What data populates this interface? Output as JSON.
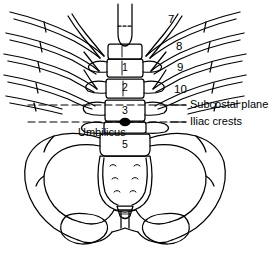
{
  "figure": {
    "style": {
      "line_color": "#000000",
      "background": "#ffffff",
      "text_color": "#000000"
    }
  },
  "rib_labels": [
    {
      "name": "rib-7",
      "text": "7",
      "x": 168,
      "y": 14
    },
    {
      "name": "rib-8",
      "text": "8",
      "x": 176,
      "y": 41
    },
    {
      "name": "rib-9",
      "text": "9",
      "x": 177,
      "y": 62
    },
    {
      "name": "rib-10",
      "text": "10",
      "x": 174,
      "y": 84
    }
  ],
  "vertebra_labels": [
    {
      "name": "lumbar-1",
      "text": "1",
      "x": 104,
      "y": 64
    },
    {
      "name": "lumbar-2",
      "text": "2",
      "x": 104,
      "y": 88
    },
    {
      "name": "lumbar-3",
      "text": "3",
      "x": 104,
      "y": 112
    },
    {
      "name": "lumbar-5",
      "text": "5",
      "x": 104,
      "y": 144
    }
  ],
  "plane_labels": [
    {
      "name": "subcostal-plane-label",
      "text": "Subcostal plane",
      "x": 190,
      "y": 100
    },
    {
      "name": "iliac-crests-label",
      "text": "Iliac crests",
      "x": 190,
      "y": 118
    }
  ],
  "landmark_labels": [
    {
      "name": "umbilicus-label",
      "text": "Umbilicus",
      "x": 78,
      "y": 129
    }
  ],
  "reference_lines": [
    {
      "name": "subcostal-plane-line",
      "y": 105
    },
    {
      "name": "iliac-crests-line",
      "y": 122
    }
  ]
}
